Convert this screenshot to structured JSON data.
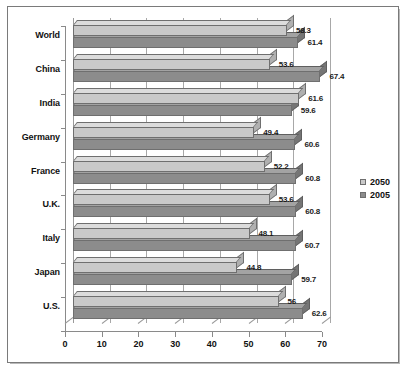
{
  "chart_data": {
    "type": "bar",
    "orientation": "horizontal",
    "title": "",
    "subtitle": "",
    "xlabel": "",
    "ylabel": "",
    "categories": [
      "World",
      "China",
      "India",
      "Germany",
      "France",
      "U.K.",
      "Italy",
      "Japan",
      "U.S."
    ],
    "series": [
      {
        "name": "2050",
        "color": "#c9c9c9",
        "values": [
          58.3,
          53.6,
          61.6,
          49.4,
          52.2,
          53.6,
          48.1,
          44.8,
          56
        ],
        "labels": [
          "58.3",
          "53.6",
          "61.6",
          "49.4",
          "52.2",
          "53.6",
          "48.1",
          "44.8",
          "56"
        ]
      },
      {
        "name": "2005",
        "color": "#8c8c8c",
        "values": [
          61.4,
          67.4,
          59.6,
          60.6,
          60.8,
          60.8,
          60.7,
          59.7,
          62.6
        ],
        "labels": [
          "61.4",
          "67.4",
          "59.6",
          "60.6",
          "60.8",
          "60.8",
          "60.7",
          "59.7",
          "62.6"
        ]
      }
    ],
    "xlim": [
      0,
      70
    ],
    "xticks": [
      0,
      10,
      20,
      30,
      40,
      50,
      60,
      70
    ],
    "xtick_labels": [
      "0",
      "10",
      "20",
      "30",
      "40",
      "50",
      "60",
      "70"
    ],
    "grid": true,
    "grid_axis": "x",
    "legend_position": "right",
    "legend_entries": [
      "2050",
      "2005"
    ],
    "style": "3d-bar",
    "border_color": "#7a7a7a",
    "background_color": "#ffffff"
  }
}
